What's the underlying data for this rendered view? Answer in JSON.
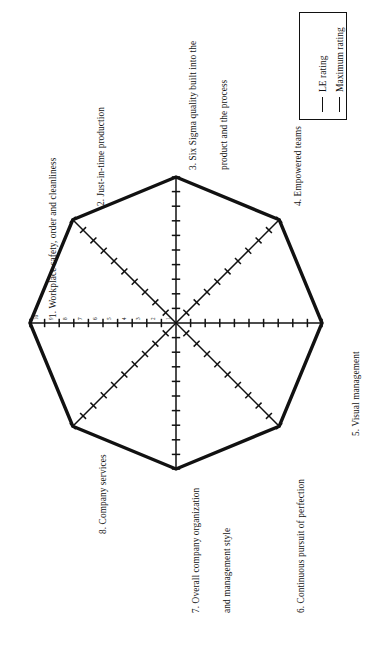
{
  "chart_data": {
    "type": "radar",
    "title": "",
    "categories": [
      "1. Workplace safety, order and cleanliness",
      "2. Just-in-time production",
      "3. Six Sigma quality built into the product and the process",
      "4. Empowered teams",
      "5. Visual management",
      "6. Continuous pursuit of perfection",
      "7. Overall company organization and management style",
      "8. Company services"
    ],
    "series": [
      {
        "name": "LE rating",
        "values": [
          10,
          10,
          10,
          10,
          10,
          10,
          10,
          10
        ],
        "style": "thin"
      },
      {
        "name": "Maximum rating",
        "values": [
          10,
          10,
          10,
          10,
          10,
          10,
          10,
          10
        ],
        "style": "thick"
      }
    ],
    "rlim": [
      0,
      10
    ],
    "tick_values": [
      1,
      2,
      3,
      4,
      5,
      6,
      7,
      8,
      9,
      10
    ],
    "tick_labels": [
      "1",
      "2",
      "3",
      "4",
      "5",
      "6",
      "7",
      "8",
      "9",
      "10"
    ],
    "labelled_axis": "1. Workplace safety, order and cleanliness",
    "grid": false,
    "legend_position": "top-right",
    "rotation_deg": -90,
    "axis_count": 8
  },
  "legend": {
    "entries": [
      {
        "label": "LE rating",
        "style": "thin"
      },
      {
        "label": "Maximum rating",
        "style": "thick"
      }
    ]
  },
  "axis_labels": [
    {
      "id": "axis-1",
      "lines": [
        "1. Workplace safety, order and cleanliness"
      ]
    },
    {
      "id": "axis-2",
      "lines": [
        "2. Just-in-time production"
      ]
    },
    {
      "id": "axis-3",
      "lines": [
        "3. Six Sigma quality built into the",
        "product and the process"
      ]
    },
    {
      "id": "axis-4",
      "lines": [
        "4. Empowered teams"
      ]
    },
    {
      "id": "axis-5",
      "lines": [
        "5. Visual management"
      ]
    },
    {
      "id": "axis-6",
      "lines": [
        "6. Continuous pursuit of perfection"
      ]
    },
    {
      "id": "axis-7",
      "lines": [
        "7. Overall company organization",
        "and management style"
      ]
    },
    {
      "id": "axis-8",
      "lines": [
        "8. Company services"
      ]
    }
  ],
  "axis_label_text": {
    "a1l1": "1. Workplace safety, order and cleanliness",
    "a2l1": "2. Just-in-time production",
    "a3l1": "3. Six Sigma quality built into the",
    "a3l2": "product and the process",
    "a4l1": "4. Empowered teams",
    "a5l1": "5. Visual management",
    "a6l1": "6. Continuous pursuit of perfection",
    "a7l1": "7. Overall company organization",
    "a7l2": "and management style",
    "a8l1": "8. Company services"
  },
  "scale_labels": {
    "t10": "10",
    "t9": "9",
    "t8": "8",
    "t7": "7",
    "t6": "6",
    "t5": "5",
    "t4": "4",
    "t3": "3",
    "t2": "2",
    "t1": "1"
  },
  "colors": {
    "ink": "#111111",
    "background": "#ffffff",
    "series_thick": "#000000",
    "series_thin": "#000000"
  }
}
